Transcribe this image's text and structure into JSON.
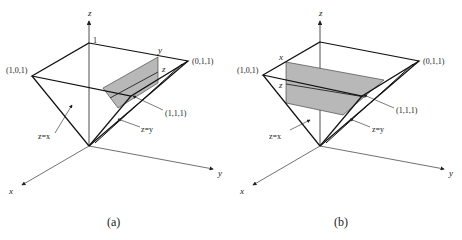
{
  "figure": {
    "panels": [
      {
        "id": "a",
        "caption": "(a)",
        "axes": {
          "x": "x",
          "y": "y",
          "z": "z"
        },
        "vertex_labels": {
          "apex": "1",
          "v101": "(1,0,1)",
          "v011": "(0,1,1)",
          "v111": "(1,1,1)"
        },
        "plane_labels": {
          "zx": "z=x",
          "zy": "z=y"
        },
        "region_labels": {
          "top": "y",
          "mid": "z"
        }
      },
      {
        "id": "b",
        "caption": "(b)",
        "axes": {
          "x": "x",
          "y": "y",
          "z": "z"
        },
        "vertex_labels": {
          "v101": "(1,0,1)",
          "v011": "(0,1,1)",
          "v111": "(1,1,1)"
        },
        "plane_labels": {
          "zx": "z=x",
          "zy": "z=y"
        },
        "region_labels": {
          "top": "x",
          "mid": "z"
        }
      }
    ],
    "colors": {
      "line": "#111111",
      "shade": "#b8b8b8",
      "axis": "#333333"
    }
  }
}
